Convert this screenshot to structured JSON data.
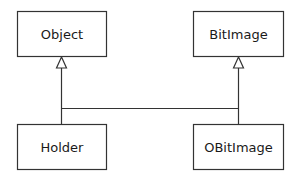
{
  "diagram": {
    "type": "uml-class-inheritance",
    "classes": [
      {
        "id": "object",
        "name": "Object"
      },
      {
        "id": "bitimage",
        "name": "BitImage"
      },
      {
        "id": "holder",
        "name": "Holder"
      },
      {
        "id": "obitimage",
        "name": "OBitImage"
      }
    ],
    "relations": [
      {
        "from": "holder",
        "to": "object",
        "kind": "generalization"
      },
      {
        "from": "obitimage",
        "to": "bitimage",
        "kind": "generalization"
      },
      {
        "from": "holder",
        "to": "obitimage",
        "kind": "shared-connector"
      }
    ],
    "colors": {
      "stroke": "#333333",
      "fill": "#ffffff",
      "text": "#1a1a1a"
    }
  }
}
